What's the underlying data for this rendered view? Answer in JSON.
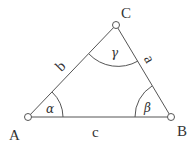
{
  "diagram": {
    "type": "triangle",
    "vertices": {
      "A": {
        "label": "A"
      },
      "B": {
        "label": "B"
      },
      "C": {
        "label": "C"
      }
    },
    "sides": {
      "a": {
        "label": "a"
      },
      "b": {
        "label": "b"
      },
      "c": {
        "label": "c"
      }
    },
    "angles": {
      "alpha": {
        "label": "α"
      },
      "beta": {
        "label": "β"
      },
      "gamma": {
        "label": "γ"
      }
    },
    "colors": {
      "stroke": "#555555",
      "text": "#333333",
      "background": "#ffffff"
    }
  }
}
